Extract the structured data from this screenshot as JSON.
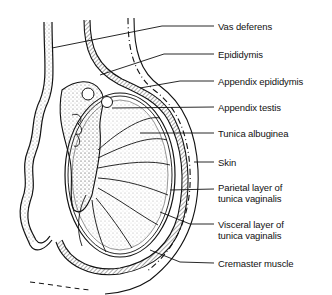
{
  "figure": {
    "labels": [
      {
        "id": "vas-deferens",
        "line1": "Vas deferens",
        "line2": "",
        "x": 218,
        "y": 21
      },
      {
        "id": "epididymis",
        "line1": "Epididymis",
        "line2": "",
        "x": 218,
        "y": 49
      },
      {
        "id": "appendix-epididymis",
        "line1": "Appendix epididymis",
        "line2": "",
        "x": 218,
        "y": 76
      },
      {
        "id": "appendix-testis",
        "line1": "Appendix testis",
        "line2": "",
        "x": 218,
        "y": 102
      },
      {
        "id": "tunica-albuginea",
        "line1": "Tunica albuginea",
        "line2": "",
        "x": 218,
        "y": 128
      },
      {
        "id": "skin",
        "line1": "Skin",
        "line2": "",
        "x": 218,
        "y": 157
      },
      {
        "id": "parietal-layer",
        "line1": "Parietal layer of",
        "line2": "tunica vaginalis",
        "x": 218,
        "y": 182
      },
      {
        "id": "visceral-layer",
        "line1": "Visceral layer of",
        "line2": "tunica vaginalis",
        "x": 218,
        "y": 219
      },
      {
        "id": "cremaster-muscle",
        "line1": "Cremaster muscle",
        "line2": "",
        "x": 218,
        "y": 258
      }
    ]
  }
}
